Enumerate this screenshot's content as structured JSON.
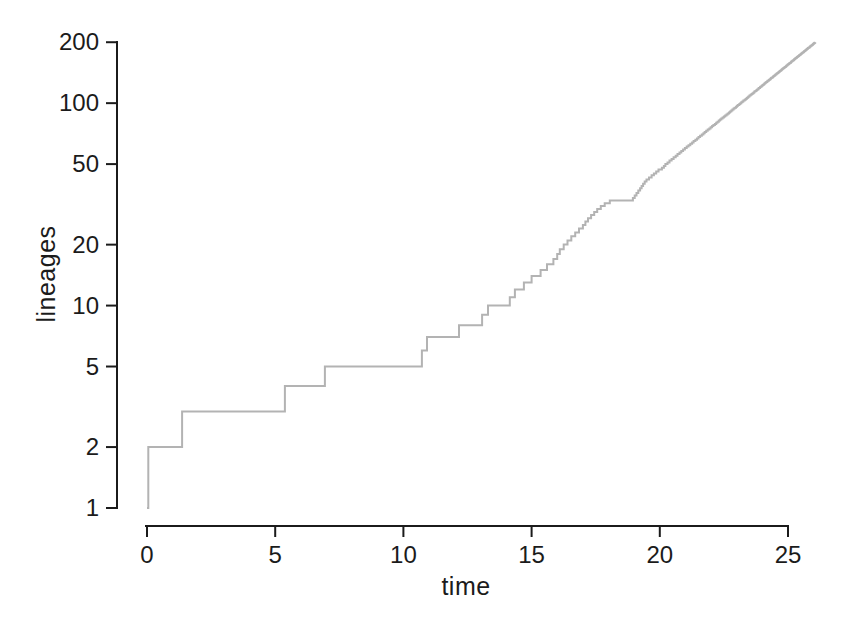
{
  "figure": {
    "background_color": "#ffffff"
  },
  "chart_data": {
    "type": "line",
    "subtype": "step",
    "title": "",
    "xlabel": "time",
    "ylabel": "lineages",
    "x_ticks": [
      0,
      5,
      10,
      15,
      20,
      25
    ],
    "y_ticks": [
      1,
      2,
      5,
      10,
      20,
      50,
      100,
      200
    ],
    "xlim": [
      0,
      26.1
    ],
    "ylim": [
      1,
      200
    ],
    "y_scale": "log",
    "grid": false,
    "legend": "none",
    "line_color": "#b3b3b3",
    "axis_color": "#1b1b1b",
    "start": {
      "time": 0,
      "lineages": 1
    },
    "final_lineages": 200,
    "event_times": [
      0.05,
      1.37,
      5.38,
      6.94,
      10.72,
      10.92,
      12.17,
      13.07,
      13.3,
      14.15,
      14.35,
      14.7,
      15.0,
      15.35,
      15.6,
      15.85,
      16.0,
      16.1,
      16.25,
      16.4,
      16.55,
      16.7,
      16.85,
      17.0,
      17.1,
      17.2,
      17.32,
      17.44,
      17.56,
      17.7,
      17.85,
      18.05,
      18.95,
      19.02,
      19.09,
      19.16,
      19.23,
      19.29,
      19.35,
      19.41,
      19.48,
      19.58,
      19.68,
      19.77,
      19.86,
      19.95,
      20.08,
      20.16,
      20.22,
      20.3,
      20.38,
      20.46,
      20.54,
      20.62,
      20.69,
      20.77,
      20.84,
      20.91,
      20.98,
      21.05,
      21.12,
      21.19,
      21.26,
      21.32,
      21.39,
      21.45,
      21.51,
      21.57,
      21.64,
      21.7,
      21.75,
      21.81,
      21.87,
      21.93,
      21.98,
      22.04,
      22.09,
      22.15,
      22.2,
      22.25,
      22.3,
      22.35,
      22.4,
      22.45,
      22.5,
      22.55,
      22.6,
      22.65,
      22.7,
      22.74,
      22.79,
      22.83,
      22.88,
      22.92,
      22.97,
      23.01,
      23.05,
      23.1,
      23.14,
      23.18,
      23.22,
      23.26,
      23.31,
      23.35,
      23.39,
      23.43,
      23.46,
      23.5,
      23.54,
      23.58,
      23.62,
      23.66,
      23.69,
      23.73,
      23.77,
      23.8,
      23.84,
      23.87,
      23.91,
      23.94,
      23.98,
      24.01,
      24.05,
      24.08,
      24.11,
      24.15,
      24.18,
      24.21,
      24.25,
      24.28,
      24.31,
      24.34,
      24.37,
      24.41,
      24.44,
      24.47,
      24.5,
      24.53,
      24.56,
      24.59,
      24.62,
      24.65,
      24.68,
      24.71,
      24.74,
      24.76,
      24.79,
      24.82,
      24.85,
      24.88,
      24.91,
      24.93,
      24.96,
      24.99,
      25.02,
      25.04,
      25.07,
      25.1,
      25.12,
      25.15,
      25.17,
      25.2,
      25.23,
      25.25,
      25.28,
      25.3,
      25.33,
      25.35,
      25.38,
      25.4,
      25.43,
      25.45,
      25.48,
      25.5,
      25.52,
      25.55,
      25.57,
      25.6,
      25.62,
      25.64,
      25.67,
      25.69,
      25.71,
      25.74,
      25.76,
      25.78,
      25.8,
      25.83,
      25.85,
      25.87,
      25.89,
      25.91,
      25.94,
      25.96,
      25.98,
      26.0,
      26.02,
      26.04,
      26.06
    ]
  }
}
